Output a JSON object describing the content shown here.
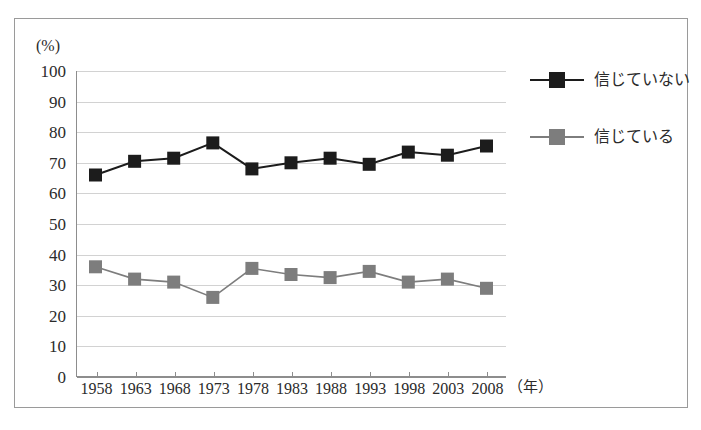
{
  "chart_data": {
    "type": "line",
    "title": "",
    "xlabel": "（年）",
    "ylabel": "(%)",
    "x": [
      1958,
      1963,
      1968,
      1973,
      1978,
      1983,
      1988,
      1993,
      1998,
      2003,
      2008
    ],
    "categories": [
      "1958",
      "1963",
      "1968",
      "1973",
      "1978",
      "1983",
      "1988",
      "1993",
      "1998",
      "2003",
      "2008"
    ],
    "ylim": [
      0,
      100
    ],
    "yticks": [
      0,
      10,
      20,
      30,
      40,
      50,
      60,
      70,
      80,
      90,
      100
    ],
    "ytick_labels": [
      "0",
      "10",
      "20",
      "30",
      "40",
      "50",
      "60",
      "70",
      "80",
      "90",
      "100"
    ],
    "grid": true,
    "legend_position": "right",
    "series": [
      {
        "name": "信じていない",
        "color": "#1c1c1c",
        "marker": "square",
        "values": [
          66,
          70.5,
          71.5,
          76.5,
          68,
          70,
          71.5,
          69.5,
          73.5,
          72.5,
          75.5
        ]
      },
      {
        "name": "信じている",
        "color": "#7d7d7d",
        "marker": "square",
        "values": [
          36,
          32,
          31,
          26,
          35.5,
          33.5,
          32.5,
          34.5,
          31,
          32,
          29
        ]
      }
    ]
  },
  "axis": {
    "unit_y": "(%)",
    "unit_x": "（年）"
  },
  "legend": {
    "items": [
      {
        "label": "信じていない",
        "color": "#1c1c1c"
      },
      {
        "label": "信じている",
        "color": "#7d7d7d"
      }
    ]
  },
  "colors": {
    "series_dark": "#1c1c1c",
    "series_gray": "#7d7d7d",
    "gridline": "#d2d2d2",
    "axis": "#8d8d8d",
    "frame": "#9a9a9a",
    "background": "#ffffff",
    "text": "#2b2b2b"
  }
}
